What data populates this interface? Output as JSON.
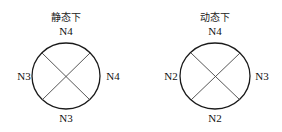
{
  "diagrams": [
    {
      "title": "静态下",
      "labels": {
        "top": "N4",
        "left": "N3",
        "right": "N4",
        "bottom": "N3"
      }
    },
    {
      "title": "动态下",
      "labels": {
        "top": "N4",
        "left": "N2",
        "right": "N3",
        "bottom": "N2"
      }
    }
  ],
  "colors": {
    "stroke": "#1a1a1a",
    "cross": "#444444"
  }
}
